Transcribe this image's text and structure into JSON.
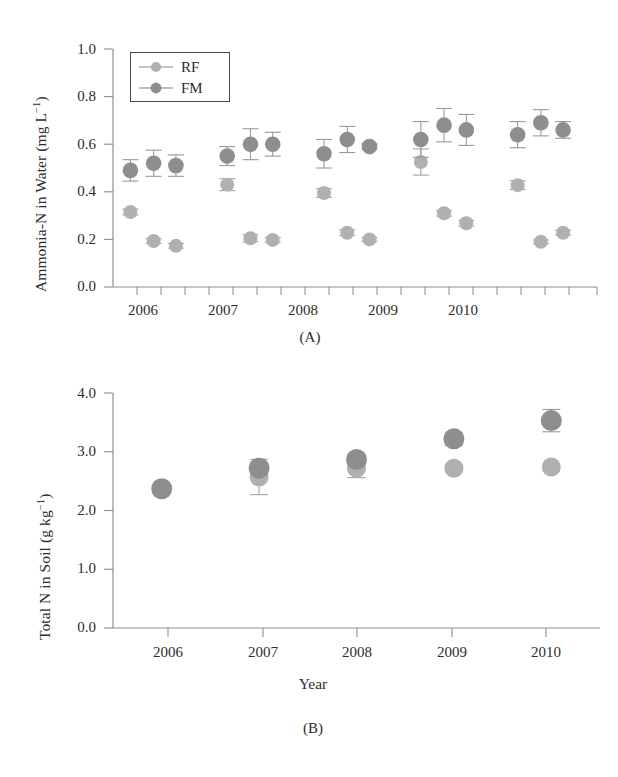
{
  "figure": {
    "background": "#ffffff",
    "colors": {
      "rf": "#b0b0b0",
      "fm": "#8e8e8e",
      "axis": "#8d8d8d",
      "text": "#2c2c2c"
    }
  },
  "legend": {
    "position": "top-left-inside-panel-A",
    "entries": [
      {
        "label": "RF",
        "color": "#b0b0b0",
        "marker": "filled-circle-with-line"
      },
      {
        "label": "FM",
        "color": "#8e8e8e",
        "marker": "filled-circle-with-line"
      }
    ]
  },
  "panel_a": {
    "tag": "(A)",
    "ylabel_parts": {
      "main": "Ammonia-N in Water (mg L",
      "exp": "−1",
      "tail": ")"
    },
    "ylabel": "Ammonia-N in Water (mg L−1)",
    "yticks": [
      "1.0",
      "0.8",
      "0.6",
      "0.4",
      "0.2",
      "0.0"
    ],
    "xticks": [
      "2006",
      "2007",
      "2008",
      "2009",
      "2010"
    ]
  },
  "panel_b": {
    "tag": "(B)",
    "ylabel_parts": {
      "main": "Total N in Soil (g kg",
      "exp": "−1",
      "tail": ")"
    },
    "ylabel": "Total N in Soil (g kg−1)",
    "xlabel": "Year",
    "yticks": [
      "4.0",
      "3.0",
      "2.0",
      "1.0",
      "0.0"
    ],
    "xticks": [
      "2006",
      "2007",
      "2008",
      "2009",
      "2010"
    ]
  },
  "chart_data": [
    {
      "id": "panel-a",
      "type": "scatter",
      "title": "(A)",
      "xlabel": "",
      "ylabel": "Ammonia-N in Water (mg L^-1)",
      "ylim": [
        0.0,
        1.0
      ],
      "ytick_values": [
        0.0,
        0.2,
        0.4,
        0.6,
        0.8,
        1.0
      ],
      "xlim": [
        2005.6,
        2010.6
      ],
      "xtick_values": [
        2006,
        2007,
        2008,
        2009,
        2010
      ],
      "xtick_labels": [
        "2006",
        "2007",
        "2008",
        "2009",
        "2010"
      ],
      "grid": false,
      "legend": [
        "RF",
        "FM"
      ],
      "legend_position": "upper left",
      "errorbars": "std-error-caps",
      "x": [
        2005.78,
        2006.02,
        2006.25,
        2006.78,
        2007.02,
        2007.25,
        2007.78,
        2008.02,
        2008.25,
        2008.78,
        2009.02,
        2009.25,
        2009.78,
        2010.02,
        2010.25
      ],
      "series": [
        {
          "name": "FM",
          "color": "#8e8e8e",
          "values": [
            0.49,
            0.52,
            0.51,
            0.55,
            0.6,
            0.6,
            0.56,
            0.62,
            0.59,
            0.62,
            0.68,
            0.66,
            0.64,
            0.69,
            0.66
          ],
          "errors": [
            0.045,
            0.055,
            0.045,
            0.04,
            0.065,
            0.05,
            0.06,
            0.055,
            0.012,
            0.075,
            0.07,
            0.065,
            0.055,
            0.055,
            0.035
          ]
        },
        {
          "name": "RF",
          "color": "#b0b0b0",
          "values": [
            0.315,
            0.193,
            0.173,
            0.43,
            0.205,
            0.198,
            0.395,
            0.228,
            0.2,
            0.525,
            0.31,
            0.268,
            0.428,
            0.19,
            0.228
          ],
          "errors": [
            0.012,
            0.01,
            0.01,
            0.025,
            0.015,
            0.01,
            0.018,
            0.012,
            0.008,
            0.055,
            0.012,
            0.012,
            0.018,
            0.008,
            0.01
          ]
        }
      ]
    },
    {
      "id": "panel-b",
      "type": "scatter",
      "title": "(B)",
      "xlabel": "Year",
      "ylabel": "Total N in Soil (g kg^-1)",
      "ylim": [
        0.0,
        4.0
      ],
      "ytick_values": [
        0.0,
        1.0,
        2.0,
        3.0,
        4.0
      ],
      "xlim": [
        2005.5,
        2010.5
      ],
      "xtick_values": [
        2006,
        2007,
        2008,
        2009,
        2010
      ],
      "xtick_labels": [
        "2006",
        "2007",
        "2008",
        "2009",
        "2010"
      ],
      "grid": false,
      "legend": [
        "RF",
        "FM"
      ],
      "errorbars": "std-error-caps",
      "x": [
        2006,
        2007,
        2008,
        2009,
        2010
      ],
      "series": [
        {
          "name": "FM",
          "color": "#8e8e8e",
          "values": [
            2.37,
            2.72,
            2.87,
            3.22,
            3.53
          ],
          "errors": [
            0.0,
            0.1,
            0.09,
            0.11,
            0.19
          ]
        },
        {
          "name": "RF",
          "color": "#b0b0b0",
          "values": [
            2.37,
            2.57,
            2.72,
            2.72,
            2.74
          ],
          "errors": [
            0.0,
            0.3,
            0.16,
            0.06,
            0.0
          ]
        }
      ]
    }
  ]
}
